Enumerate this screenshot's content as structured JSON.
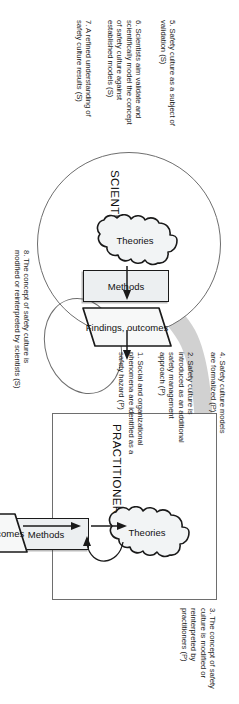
{
  "figure": {
    "type": "relationship-diagram",
    "groups": [
      {
        "id": "practitioners",
        "title": "PRACTITIONERS",
        "shape": "rectangle"
      },
      {
        "id": "scientists",
        "title": "SCIENTISTS",
        "shape": "ellipse"
      }
    ],
    "nodes": {
      "theories": "Theories",
      "methods": "Methods",
      "findings": "Findings,\noutcomes"
    }
  },
  "annotations": [
    {
      "num": "1.",
      "text": "1. Social and organizational\nphenomena are identified as a\nsafety hazard (P)",
      "actor": "P"
    },
    {
      "num": "2.",
      "text": "2. Safety culture is\nintroduced as an additional\nsafety management\napproach (P)",
      "actor": "P"
    },
    {
      "num": "3.",
      "text": "3. The concept of safety\nculture is modified or\nreinterpreted by\npractitioners (P)",
      "actor": "P"
    },
    {
      "num": "4.",
      "text": "4. Safety culture models\nare formalized (P)",
      "actor": "P"
    },
    {
      "num": "5.",
      "text": "5. Safety culture as a subject of\nvalidation (S)",
      "actor": "S"
    },
    {
      "num": "6.",
      "text": "6. Scientists aim validate and\nscientifically model the concept\nof safety culture against\nestablished models (S)",
      "actor": "S"
    },
    {
      "num": "7.",
      "text": "7. A refined understanding of\nsafety culture results (S)",
      "actor": "S"
    },
    {
      "num": "8.",
      "text": "8. The concept of safety culture is\nmodified or reinterpreted by scientists (S)",
      "actor": "S"
    }
  ],
  "colors": {
    "node_fill": "#eceff1",
    "node_stroke": "#1a1a1a",
    "group_stroke": "#6e6e6e",
    "band": "#c9c9c9",
    "text": "#1a1a1a"
  }
}
